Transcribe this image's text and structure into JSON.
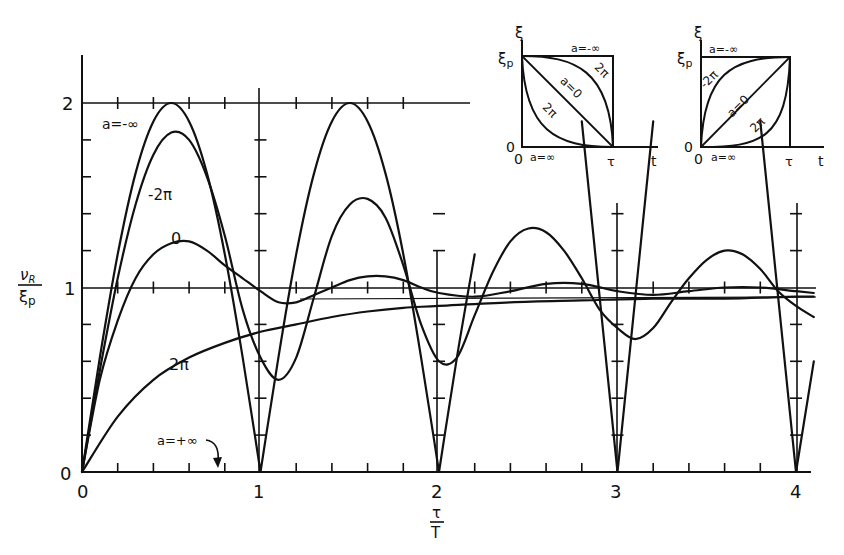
{
  "chart_data": {
    "type": "line",
    "title": "",
    "xlabel": "τ/T",
    "ylabel": "ν_R / ξ_p",
    "xlim": [
      0,
      4.1
    ],
    "ylim": [
      0,
      2.3
    ],
    "x_ticks": [
      "0",
      "1",
      "2",
      "3",
      "4"
    ],
    "y_ticks": [
      "0",
      "1",
      "2"
    ],
    "grid": "partial (horizontal at 1 and 2, vertical at integer τ/T)",
    "legend": "inline curve labels",
    "series": [
      {
        "name": "a = -∞",
        "label": "a=-∞",
        "x": [
          0,
          0.1,
          0.2,
          0.3,
          0.4,
          0.5,
          0.6,
          0.7,
          0.8,
          0.9,
          1.0,
          1.1,
          1.2,
          1.3,
          1.4,
          1.5,
          1.6,
          1.7,
          1.8,
          1.9,
          2.0,
          2.1,
          2.2,
          2.35,
          2.5,
          2.65,
          2.8,
          2.9,
          3.0,
          3.1,
          3.2,
          3.4,
          3.6,
          3.8,
          3.9,
          4.0,
          4.1
        ],
        "values": [
          0,
          0.62,
          1.18,
          1.62,
          1.9,
          2.0,
          1.9,
          1.62,
          1.18,
          0.62,
          0,
          0.62,
          1.18,
          1.62,
          1.9,
          2.0,
          1.9,
          1.62,
          1.18,
          0.62,
          0,
          0.62,
          1.18,
          null,
          null,
          null,
          1.9,
          0.95,
          0,
          0.95,
          1.9,
          null,
          null,
          1.9,
          0.95,
          0,
          0.6
        ]
      },
      {
        "name": "a = -2π",
        "label": "-2π",
        "x": [
          0,
          0.1,
          0.2,
          0.3,
          0.4,
          0.5,
          0.6,
          0.7,
          0.8,
          0.9,
          1.0,
          1.1,
          1.2,
          1.3,
          1.4,
          1.5,
          1.6,
          1.7,
          1.8,
          1.9,
          2.0,
          2.1,
          2.2,
          2.3,
          2.4,
          2.5,
          2.6,
          2.7,
          2.8,
          2.9,
          3.0,
          3.1,
          3.2,
          3.3,
          3.4,
          3.5,
          3.6,
          3.7,
          3.8,
          3.9,
          4.0,
          4.1
        ],
        "values": [
          0,
          0.55,
          1.05,
          1.45,
          1.72,
          1.84,
          1.8,
          1.6,
          1.28,
          0.88,
          0.62,
          0.5,
          0.62,
          0.95,
          1.28,
          1.45,
          1.48,
          1.38,
          1.12,
          0.8,
          0.6,
          0.62,
          0.85,
          1.08,
          1.25,
          1.32,
          1.3,
          1.2,
          1.05,
          0.88,
          0.78,
          0.72,
          0.78,
          0.92,
          1.05,
          1.15,
          1.2,
          1.18,
          1.1,
          0.98,
          0.9,
          0.84
        ]
      },
      {
        "name": "a = 0",
        "label": "0",
        "x": [
          0,
          0.1,
          0.2,
          0.3,
          0.4,
          0.5,
          0.6,
          0.7,
          0.8,
          0.9,
          1.0,
          1.1,
          1.2,
          1.3,
          1.4,
          1.5,
          1.6,
          1.7,
          1.8,
          1.9,
          2.0,
          2.2,
          2.4,
          2.6,
          2.8,
          3.0,
          3.2,
          3.4,
          3.6,
          3.8,
          4.0,
          4.1
        ],
        "values": [
          0,
          0.5,
          0.82,
          1.05,
          1.18,
          1.24,
          1.25,
          1.2,
          1.12,
          1.05,
          0.98,
          0.92,
          0.92,
          0.96,
          1.0,
          1.04,
          1.06,
          1.06,
          1.04,
          1.0,
          0.97,
          0.95,
          0.98,
          1.02,
          1.02,
          0.98,
          0.96,
          0.98,
          1.0,
          1.0,
          0.98,
          0.97
        ]
      },
      {
        "name": "a = 2π",
        "label": "2π",
        "x": [
          0,
          0.2,
          0.4,
          0.6,
          0.8,
          1.0,
          1.2,
          1.4,
          1.6,
          1.8,
          2.0,
          2.4,
          2.8,
          3.2,
          3.6,
          4.0,
          4.1
        ],
        "values": [
          0,
          0.3,
          0.5,
          0.62,
          0.7,
          0.76,
          0.8,
          0.84,
          0.87,
          0.89,
          0.9,
          0.92,
          0.93,
          0.94,
          0.94,
          0.95,
          0.95
        ]
      }
    ],
    "annotations": [
      {
        "text": "a=-∞",
        "x": 0.02,
        "y": 1.9
      },
      {
        "text": "-2π",
        "x": 0.3,
        "y": 1.57
      },
      {
        "text": "0",
        "x": 0.28,
        "y": 1.2
      },
      {
        "text": "2π",
        "x": 0.27,
        "y": 0.68
      },
      {
        "text": "a=+∞",
        "x": 0.5,
        "y": 0.12,
        "note": "arrow pointing to curve on axis at τ/T≈0.75"
      }
    ],
    "insets": [
      {
        "position": "top-right left",
        "y_axis_label": "ξ",
        "y_top_label": "ξp",
        "x_axis_label": "t",
        "x_end_label": "τ",
        "origin_labels": [
          "0",
          "0"
        ],
        "curve_labels": [
          "a=-∞",
          "-2π",
          "a=0",
          "2π",
          "a=∞"
        ],
        "description": "decreasing profiles from ξp to 0 over [0, τ]"
      },
      {
        "position": "top-right right",
        "y_axis_label": "ξ",
        "y_top_label": "ξp",
        "x_axis_label": "t",
        "x_end_label": "τ",
        "origin_labels": [
          "0",
          "0"
        ],
        "curve_labels": [
          "a=-∞",
          "-2π",
          "a=0",
          "2π",
          "a=∞"
        ],
        "description": "increasing profiles from 0 to ξp over [0, τ]"
      }
    ]
  },
  "axes": {
    "x_label_num": "τ",
    "x_label_den": "T",
    "y_label_num": "ν",
    "y_label_num_sub": "R",
    "y_label_den": "ξ",
    "y_label_den_sub": "p",
    "y_tick_0": "0",
    "y_tick_1": "1",
    "y_tick_2": "2",
    "x_tick_0": "0",
    "x_tick_1": "1",
    "x_tick_2": "2",
    "x_tick_3": "3",
    "x_tick_4": "4"
  },
  "labels": {
    "a_neg_inf": "a=-∞",
    "neg_2pi": "-2π",
    "zero": "0",
    "two_pi": "2π",
    "a_pos_inf": "a=+∞"
  },
  "inset1": {
    "xi": "ξ",
    "xip": "ξ",
    "xip_sub": "p",
    "t": "t",
    "tau": "τ",
    "o1": "0",
    "o2": "0",
    "top": "a=-∞",
    "bottom": "a=∞",
    "mid": "a=0",
    "upper": "2π",
    "lower": "2π"
  },
  "inset2": {
    "xi": "ξ",
    "xip": "ξ",
    "xip_sub": "p",
    "t": "t",
    "tau": "τ",
    "o1": "0",
    "o2": "0",
    "top": "a=-∞",
    "bottom": "a=∞",
    "mid": "a=0",
    "upper": "-2π",
    "lower": "2π"
  }
}
